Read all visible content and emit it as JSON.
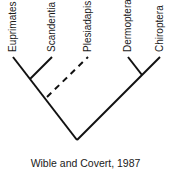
{
  "diagram": {
    "type": "cladogram",
    "line_color": "#111111",
    "taxa": [
      {
        "name": "Euprimates",
        "x": 13,
        "y": 57
      },
      {
        "name": "Scandentia",
        "x": 52,
        "y": 57
      },
      {
        "name": "Plesiadapis",
        "x": 88,
        "y": 57
      },
      {
        "name": "Dermoptera",
        "x": 128,
        "y": 57
      },
      {
        "name": "Chiroptera",
        "x": 160,
        "y": 57
      }
    ],
    "branches": [
      {
        "from": "root",
        "to": "Euprimates",
        "style": "solid"
      },
      {
        "from": "euprimates-scandentia-node",
        "to": "Scandentia",
        "style": "solid"
      },
      {
        "from": "plesiadapis-node",
        "to": "Plesiadapis",
        "style": "dashed"
      },
      {
        "from": "root",
        "to": "Chiroptera",
        "style": "solid"
      },
      {
        "from": "dermoptera-chiroptera-node",
        "to": "Dermoptera",
        "style": "solid"
      }
    ],
    "caption": "Wible and Covert, 1987"
  }
}
